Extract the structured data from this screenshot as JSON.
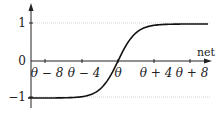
{
  "chart_data": {
    "type": "line",
    "title": "",
    "xlabel": "net",
    "ylabel": "",
    "x_tick_labels": [
      "θ − 8",
      "θ − 4",
      "θ",
      "θ + 4",
      "θ + 8"
    ],
    "x_tick_offsets": [
      -8,
      -4,
      0,
      4,
      8
    ],
    "y_tick_labels": [
      "1",
      "0",
      "−1"
    ],
    "y_ticks": [
      1,
      0,
      -1
    ],
    "ylim": [
      -1,
      1
    ],
    "xlim": [
      -10,
      10
    ],
    "grid": {
      "y_lines": [
        1,
        -1
      ],
      "style": "dotted"
    },
    "series": [
      {
        "name": "tanh((net − θ)/2)",
        "function": "tanh",
        "x": [
          -10,
          -8,
          -6,
          -4,
          -2,
          0,
          2,
          4,
          6,
          8,
          10
        ],
        "values": [
          -0.987,
          -0.964,
          -0.905,
          -0.762,
          -0.462,
          0,
          0.462,
          0.762,
          0.905,
          0.964,
          0.987
        ]
      }
    ],
    "legend": null
  },
  "labels": {
    "y1": "1",
    "y0": "0",
    "ym1": "−1",
    "x_axis_name": "net",
    "xt0": "θ − 8",
    "xt1": "θ − 4",
    "xt2": "θ",
    "xt3": "θ + 4",
    "xt4": "θ + 8"
  }
}
